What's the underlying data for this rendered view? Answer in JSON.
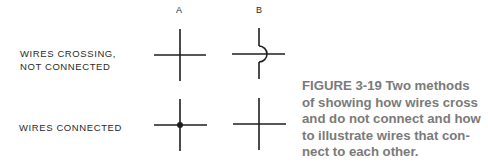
{
  "columns": {
    "a": "A",
    "b": "B"
  },
  "rows": {
    "crossing": {
      "line1": "WIRES CROSSING,",
      "line2": "NOT CONNECTED"
    },
    "connected": {
      "label": "WIRES CONNECTED"
    }
  },
  "caption": {
    "line1": "FIGURE 3-19  Two methods",
    "line2": "of showing how wires cross",
    "line3": "and do not connect and how",
    "line4": "to illustrate wires that con-",
    "line5": "nect to each other."
  }
}
